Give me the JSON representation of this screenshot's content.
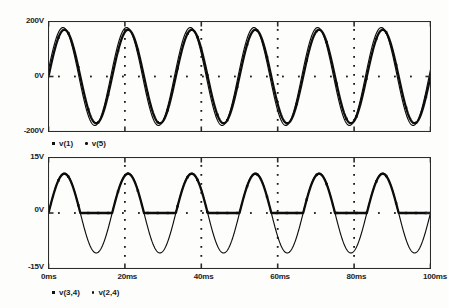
{
  "chart_data": [
    {
      "type": "line",
      "title": "",
      "subtitle": "",
      "xlabel": "",
      "ylabel": "",
      "grid": true,
      "grid_style": "dotted",
      "legend_position": "below-plot-left",
      "xlim": [
        0,
        100
      ],
      "ylim": [
        -200,
        200
      ],
      "x_unit": "ms",
      "y_unit": "V",
      "xticks": [
        0,
        20,
        40,
        60,
        80,
        100
      ],
      "xticklabels": [
        "0ms",
        "20ms",
        "40ms",
        "60ms",
        "80ms",
        "100ms"
      ],
      "yticks": [
        -200,
        0,
        200
      ],
      "yticklabels": [
        "200V",
        "0V",
        "-200V"
      ],
      "frequency_hz": 60,
      "series": [
        {
          "name": "v(1)",
          "marker": "square",
          "linewidth": "thick",
          "amplitude": 170,
          "phase_deg": 0,
          "offset": 0
        },
        {
          "name": "v(5)",
          "marker": "dot",
          "linewidth": "thin",
          "amplitude": 178,
          "phase_deg": 8,
          "offset": 0
        }
      ]
    },
    {
      "type": "line",
      "title": "",
      "subtitle": "",
      "xlabel": "",
      "ylabel": "",
      "grid": true,
      "grid_style": "dotted",
      "legend_position": "below-plot-left",
      "xlim": [
        0,
        100
      ],
      "ylim": [
        -15,
        15
      ],
      "x_unit": "ms",
      "y_unit": "V",
      "xticks": [
        0,
        20,
        40,
        60,
        80,
        100
      ],
      "xticklabels": [
        "0ms",
        "20ms",
        "40ms",
        "60ms",
        "80ms",
        "100ms"
      ],
      "yticks": [
        -15,
        0,
        15
      ],
      "yticklabels": [
        "15V",
        "0V",
        "-15V"
      ],
      "frequency_hz": 60,
      "series": [
        {
          "name": "v(3,4)",
          "marker": "square",
          "linewidth": "thick",
          "waveform": "half-wave-rectified-sine",
          "amplitude": 10.6,
          "phase_deg": 0,
          "offset": 0
        },
        {
          "name": "v(2,4)",
          "marker": "dot",
          "linewidth": "thin",
          "waveform": "sine",
          "amplitude": 10.8,
          "phase_deg": 0,
          "offset": 0
        }
      ]
    }
  ],
  "top_plot": {
    "y_labels": {
      "top": "200V",
      "mid": "0V",
      "bottom": "-200V"
    },
    "legend": [
      {
        "marker": "square",
        "label": "v(1)"
      },
      {
        "marker": "dot",
        "label": "v(5)"
      }
    ]
  },
  "bottom_plot": {
    "y_labels": {
      "top": "15V",
      "mid": "0V",
      "bottom": "-15V"
    },
    "x_labels": [
      "0ms",
      "20ms",
      "40ms",
      "60ms",
      "80ms",
      "100ms"
    ],
    "legend": [
      {
        "marker": "square",
        "label": "v(3,4)"
      },
      {
        "marker": "dot",
        "label": "v(2,4)"
      }
    ]
  },
  "colors": {
    "trace": "#0d0d0d",
    "frame": "#2b2b2b",
    "background": "#fdfdfb",
    "text": "#1b1b1b"
  }
}
